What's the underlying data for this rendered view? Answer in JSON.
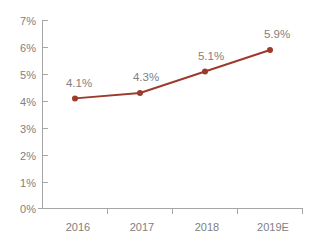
{
  "chart_data": {
    "type": "line",
    "title": "",
    "subtitle": "",
    "xlabel": "",
    "ylabel": "",
    "categories": [
      "2016",
      "2017",
      "2018",
      "2019E"
    ],
    "values": [
      4.1,
      4.3,
      5.1,
      5.9
    ],
    "point_labels": [
      "4.1%",
      "4.3%",
      "5.1%",
      "5.9%"
    ],
    "series": [
      {
        "name": "",
        "values": [
          4.1,
          4.3,
          5.1,
          5.9
        ],
        "color": "#9c3b2b",
        "marker": "circle"
      }
    ],
    "ylim": [
      0,
      7
    ],
    "ytick_values": [
      0,
      1,
      2,
      3,
      4,
      5,
      6,
      7
    ],
    "ytick_labels": [
      "0%",
      "1%",
      "2%",
      "3%",
      "4%",
      "5%",
      "6%",
      "7%"
    ],
    "xtick_labels": [
      "2016",
      "2017",
      "2018",
      "2019E"
    ],
    "grid": false,
    "legend": false,
    "legend_position": "none",
    "axis_color": "#a6a6a6",
    "tick_label_color": "#808080",
    "data_label_color": "#7f7f7f",
    "background_color": "#ffffff"
  },
  "axis": {
    "y_labels": [
      "7%",
      "6%",
      "5%",
      "4%",
      "3%",
      "2%",
      "1%",
      "0%"
    ],
    "x_labels": [
      "2016",
      "2017",
      "2018",
      "2019E"
    ]
  },
  "labels": {
    "p0": "4.1%",
    "p1": "4.3%",
    "p2": "5.1%",
    "p3": "5.9%"
  }
}
